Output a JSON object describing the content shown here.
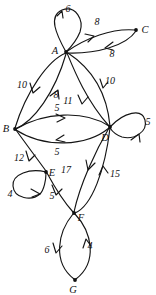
{
  "diagram": {
    "type": "directed-weighted-graph",
    "title": "",
    "colors": {
      "stroke": "#141414",
      "node": "#111111",
      "background": "#ffffff"
    },
    "nodes": [
      {
        "id": "A",
        "label": "A",
        "x": 66,
        "y": 52,
        "label_x": 55,
        "label_y": 54
      },
      {
        "id": "B",
        "label": "B",
        "x": 15,
        "y": 129,
        "label_x": 6,
        "label_y": 132
      },
      {
        "id": "C",
        "label": "C",
        "x": 136,
        "y": 30,
        "label_x": 142,
        "label_y": 33
      },
      {
        "id": "D",
        "label": "D",
        "x": 110,
        "y": 127,
        "label_x": 105,
        "label_y": 141
      },
      {
        "id": "E",
        "label": "E",
        "x": 46,
        "y": 172,
        "label_x": 50,
        "label_y": 176
      },
      {
        "id": "F",
        "label": "F",
        "x": 74,
        "y": 213,
        "label_x": 79,
        "label_y": 220
      },
      {
        "id": "G",
        "label": "G",
        "x": 75,
        "y": 280,
        "label_x": 71,
        "label_y": 292
      }
    ],
    "edges": [
      {
        "from": "A",
        "to": "A",
        "weight": "6",
        "label_x": 68,
        "label_y": 12,
        "kind": "self-loop"
      },
      {
        "from": "A",
        "to": "C",
        "weight": "8",
        "label_x": 97,
        "label_y": 25,
        "kind": "curve"
      },
      {
        "from": "C",
        "to": "A",
        "weight": "8",
        "label_x": 112,
        "label_y": 57,
        "kind": "curve"
      },
      {
        "from": "A",
        "to": "B",
        "weight": "10",
        "label_x": 22,
        "label_y": 88,
        "kind": "curve"
      },
      {
        "from": "B",
        "to": "A",
        "weight": "8",
        "label_x": 55,
        "label_y": 98,
        "kind": "curve"
      },
      {
        "from": "A",
        "to": "D",
        "weight": "11",
        "label_x": 68,
        "label_y": 104,
        "kind": "curve"
      },
      {
        "from": "D",
        "to": "A",
        "weight": "10",
        "label_x": 108,
        "label_y": 84,
        "kind": "curve"
      },
      {
        "from": "B",
        "to": "D",
        "weight": "5",
        "label_x": 57,
        "label_y": 111,
        "kind": "curve"
      },
      {
        "from": "D",
        "to": "B",
        "weight": "5",
        "label_x": 57,
        "label_y": 152,
        "kind": "curve"
      },
      {
        "from": "D",
        "to": "D",
        "weight": "5",
        "label_x": 146,
        "label_y": 124,
        "kind": "self-loop"
      },
      {
        "from": "B",
        "to": "E",
        "weight": "12",
        "label_x": 19,
        "label_y": 161,
        "kind": "curve"
      },
      {
        "from": "E",
        "to": "E",
        "weight": "4",
        "label_x": 10,
        "label_y": 196,
        "kind": "self-loop"
      },
      {
        "from": "E",
        "to": "F",
        "weight": "5",
        "label_x": 51,
        "label_y": 198,
        "kind": "curve"
      },
      {
        "from": "D",
        "to": "F",
        "weight": "17",
        "label_x": 66,
        "label_y": 173,
        "kind": "curve"
      },
      {
        "from": "F",
        "to": "D",
        "weight": "15",
        "label_x": 113,
        "label_y": 176,
        "kind": "curve"
      },
      {
        "from": "F",
        "to": "G",
        "weight": "6",
        "label_x": 47,
        "label_y": 251,
        "kind": "curve"
      },
      {
        "from": "G",
        "to": "F",
        "weight": "4",
        "label_x": 89,
        "label_y": 248,
        "kind": "curve"
      }
    ]
  }
}
